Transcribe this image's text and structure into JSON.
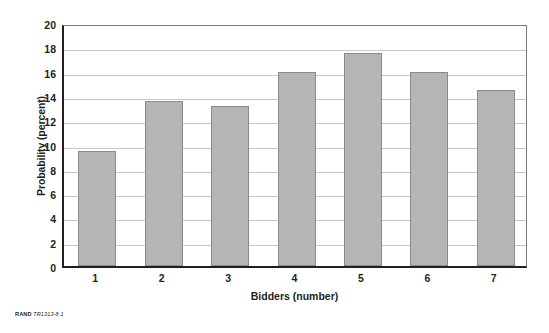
{
  "chart_data": {
    "type": "bar",
    "title": "",
    "xlabel": "Bidders (number)",
    "ylabel": "Probability (percent)",
    "categories": [
      "1",
      "2",
      "3",
      "4",
      "5",
      "6",
      "7"
    ],
    "values": [
      9.5,
      13.6,
      13.2,
      16.0,
      17.5,
      16.0,
      14.5
    ],
    "ylim": [
      0,
      20
    ],
    "ytick_labels": [
      "0",
      "2",
      "4",
      "6",
      "8",
      "10",
      "12",
      "14",
      "16",
      "18",
      "20"
    ],
    "ytick_values": [
      0,
      2,
      4,
      6,
      8,
      10,
      12,
      14,
      16,
      18,
      20
    ],
    "grid": "horizontal",
    "legend": "none",
    "series": [
      {
        "name": "Probability",
        "values": [
          9.5,
          13.6,
          13.2,
          16.0,
          17.5,
          16.0,
          14.5
        ]
      }
    ],
    "colors": {
      "bar_fill": "#b5b5b5",
      "bar_edge": "#8a8a8a",
      "axis": "#231f20",
      "gridline": "#c9c9c9",
      "background": "#ffffff"
    }
  },
  "caption": {
    "organization": "RAND",
    "figure_id": "TR1313-8.1"
  }
}
